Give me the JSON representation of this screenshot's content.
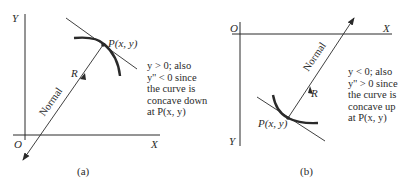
{
  "figure": {
    "panel_a": {
      "caption": "(a)",
      "axis_y_label": "Y",
      "axis_x_label": "X",
      "origin_label": "O",
      "point_label": "P(x, y)",
      "radius_label": "R",
      "normal_label": "Normal",
      "note_lines": [
        "y > 0; also",
        "y'' < 0 since",
        "the curve is",
        "concave down",
        "at P(x, y)"
      ]
    },
    "panel_b": {
      "caption": "(b)",
      "axis_y_label": "Y",
      "axis_x_label": "X",
      "origin_label": "O",
      "point_label": "P(x, y)",
      "radius_label": "R",
      "normal_label": "Normal",
      "note_lines": [
        "y < 0; also",
        "y'' > 0 since",
        "the curve is",
        "concave up",
        "at P(x, y)"
      ]
    },
    "colors": {
      "ink": "#2a2a2a",
      "background": "#ffffff"
    }
  }
}
